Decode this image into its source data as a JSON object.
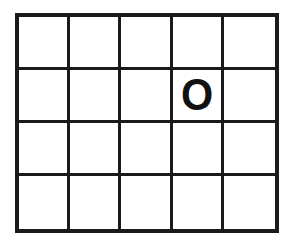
{
  "figure": {
    "type": "grid",
    "columns": 5,
    "rows": 4,
    "background_color": "#ffffff",
    "line_color": "#1a1a1a",
    "outer_border_width_px": 4,
    "inner_line_width_px": 3,
    "mark_color": "#111111"
  },
  "grid": {
    "cells": [
      [
        "",
        "",
        "",
        "",
        ""
      ],
      [
        "",
        "",
        "",
        "O",
        ""
      ],
      [
        "",
        "",
        "",
        "",
        ""
      ],
      [
        "",
        "",
        "",
        "",
        ""
      ]
    ]
  }
}
